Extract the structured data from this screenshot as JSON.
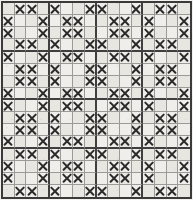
{
  "chart_data": {
    "type": "heatmap",
    "title": "",
    "subtitle": "",
    "xlabel": "",
    "ylabel": "",
    "rows": 16,
    "columns": 16,
    "grid": true,
    "legend_position": "none",
    "symbol": "X",
    "symbol_name": "cross-stitch-mark",
    "categories": [
      "1",
      "2",
      "3",
      "4",
      "5",
      "6",
      "7",
      "8",
      "9",
      "10",
      "11",
      "12",
      "13",
      "14",
      "15",
      "16"
    ],
    "row_labels": [
      "1",
      "2",
      "3",
      "4",
      "5",
      "6",
      "7",
      "8",
      "9",
      "10",
      "11",
      "12",
      "13",
      "14",
      "15",
      "16"
    ],
    "repeat_block_columns": [
      4,
      8,
      12
    ],
    "repeat_block_rows": [
      4,
      8,
      12
    ],
    "row_pattern_types": [
      "A",
      "B",
      "B",
      "A",
      "B",
      "A",
      "A",
      "B",
      "B",
      "A",
      "A",
      "B",
      "A",
      "A",
      "B",
      "B"
    ],
    "pattern_type_A_marked_columns": [
      2,
      3,
      5,
      8,
      9,
      12,
      14,
      15
    ],
    "pattern_type_B_marked_columns": [
      1,
      4,
      6,
      7,
      10,
      11,
      13,
      16
    ],
    "values": [
      [
        0,
        1,
        1,
        0,
        1,
        0,
        0,
        1,
        1,
        0,
        0,
        1,
        0,
        1,
        1,
        0
      ],
      [
        1,
        0,
        0,
        1,
        0,
        1,
        1,
        0,
        0,
        1,
        1,
        0,
        1,
        0,
        0,
        1
      ],
      [
        1,
        0,
        0,
        1,
        0,
        1,
        1,
        0,
        0,
        1,
        1,
        0,
        1,
        0,
        0,
        1
      ],
      [
        0,
        1,
        1,
        0,
        1,
        0,
        0,
        1,
        1,
        0,
        0,
        1,
        0,
        1,
        1,
        0
      ],
      [
        1,
        0,
        0,
        1,
        0,
        1,
        1,
        0,
        0,
        1,
        1,
        0,
        1,
        0,
        0,
        1
      ],
      [
        0,
        1,
        1,
        0,
        1,
        0,
        0,
        1,
        1,
        0,
        0,
        1,
        0,
        1,
        1,
        0
      ],
      [
        0,
        1,
        1,
        0,
        1,
        0,
        0,
        1,
        1,
        0,
        0,
        1,
        0,
        1,
        1,
        0
      ],
      [
        1,
        0,
        0,
        1,
        0,
        1,
        1,
        0,
        0,
        1,
        1,
        0,
        1,
        0,
        0,
        1
      ],
      [
        1,
        0,
        0,
        1,
        0,
        1,
        1,
        0,
        0,
        1,
        1,
        0,
        1,
        0,
        0,
        1
      ],
      [
        0,
        1,
        1,
        0,
        1,
        0,
        0,
        1,
        1,
        0,
        0,
        1,
        0,
        1,
        1,
        0
      ],
      [
        0,
        1,
        1,
        0,
        1,
        0,
        0,
        1,
        1,
        0,
        0,
        1,
        0,
        1,
        1,
        0
      ],
      [
        1,
        0,
        0,
        1,
        0,
        1,
        1,
        0,
        0,
        1,
        1,
        0,
        1,
        0,
        0,
        1
      ],
      [
        0,
        1,
        1,
        0,
        1,
        0,
        0,
        1,
        1,
        0,
        0,
        1,
        0,
        1,
        1,
        0
      ],
      [
        1,
        0,
        0,
        1,
        0,
        1,
        1,
        0,
        0,
        1,
        1,
        0,
        1,
        0,
        0,
        1
      ],
      [
        1,
        0,
        0,
        1,
        0,
        1,
        1,
        0,
        0,
        1,
        1,
        0,
        1,
        0,
        0,
        1
      ],
      [
        0,
        1,
        1,
        0,
        1,
        0,
        0,
        1,
        1,
        0,
        0,
        1,
        0,
        1,
        1,
        0
      ]
    ],
    "colors": {
      "mark": "#2b2b2b",
      "cell_background": "#efeeea",
      "cell_background_alt": "#e7e6e1",
      "thin_gridline": "#9b9a96",
      "thick_gridline": "#3f3f3f",
      "page_background": "#f2f1ee"
    },
    "total_marked_cells": 128,
    "total_cells": 256
  }
}
